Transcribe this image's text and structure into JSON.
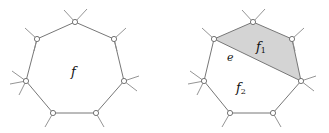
{
  "panels": [
    {
      "id": "left",
      "face_label": "f",
      "vertices": [
        [
          75,
          22
        ],
        [
          114,
          39
        ],
        [
          124,
          81
        ],
        [
          96,
          113
        ],
        [
          53,
          113
        ],
        [
          26,
          81
        ],
        [
          37,
          39
        ]
      ]
    },
    {
      "id": "right",
      "shaded_face_label": "f",
      "shaded_face_sub": "1",
      "other_face_label": "f",
      "other_face_sub": "2",
      "edge_label": "e",
      "vertices": [
        [
          253,
          22
        ],
        [
          292,
          39
        ],
        [
          301,
          81
        ],
        [
          273,
          113
        ],
        [
          230,
          113
        ],
        [
          204,
          81
        ],
        [
          214,
          39
        ]
      ]
    }
  ],
  "colors": {
    "shaded_face": "#d4d4d4",
    "edges": "#777777",
    "background": "#ffffff"
  }
}
